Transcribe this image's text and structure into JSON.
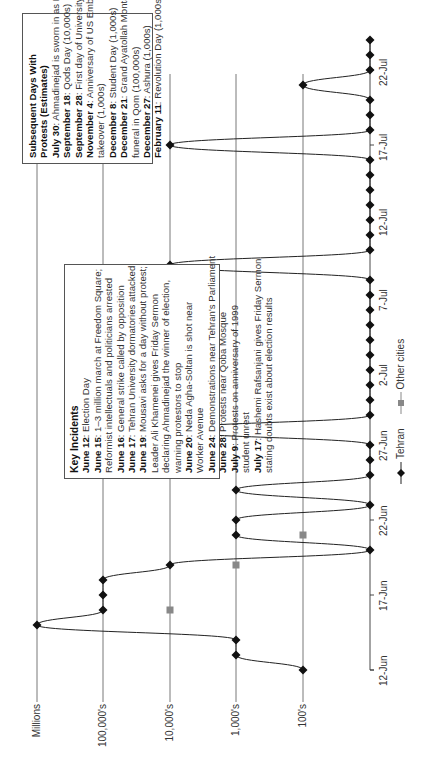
{
  "chart_data": {
    "type": "line",
    "title": "",
    "xlabel": "",
    "ylabel": "Estimated protest sizes",
    "y_scale": "ordinal-log",
    "y_levels": [
      "0",
      "100's",
      "1,000's",
      "10,000's",
      "100,000's",
      "Millions"
    ],
    "x_tick_labels": [
      "12-Jun",
      "17-Jun",
      "22-Jun",
      "27-Jun",
      "2-Jul",
      "7-Jul",
      "12-Jul",
      "17-Jul",
      "22-Jul"
    ],
    "x_range": [
      "12-Jun",
      "24-Jul"
    ],
    "grid": "horizontal lines at each size level",
    "legend_position": "bottom",
    "series": [
      {
        "name": "Tehran",
        "marker": "diamond",
        "color": "#111111",
        "points": [
          {
            "date": "12-Jun",
            "level": "100's"
          },
          {
            "date": "13-Jun",
            "level": "1,000's"
          },
          {
            "date": "14-Jun",
            "level": "1,000's"
          },
          {
            "date": "15-Jun",
            "level": "Millions"
          },
          {
            "date": "16-Jun",
            "level": "100,000's"
          },
          {
            "date": "17-Jun",
            "level": "100,000's"
          },
          {
            "date": "18-Jun",
            "level": "100,000's"
          },
          {
            "date": "19-Jun",
            "level": "10,000's"
          },
          {
            "date": "20-Jun",
            "level": "0"
          },
          {
            "date": "21-Jun",
            "level": "1,000's"
          },
          {
            "date": "22-Jun",
            "level": "1,000's"
          },
          {
            "date": "23-Jun",
            "level": "0"
          },
          {
            "date": "24-Jun",
            "level": "1,000's"
          },
          {
            "date": "25-Jun",
            "level": "0"
          },
          {
            "date": "26-Jun",
            "level": "0"
          },
          {
            "date": "27-Jun",
            "level": "0"
          },
          {
            "date": "28-Jun",
            "level": "10,000's"
          },
          {
            "date": "29-Jun",
            "level": "0"
          },
          {
            "date": "30-Jun",
            "level": "0"
          },
          {
            "date": "1-Jul",
            "level": "0"
          },
          {
            "date": "2-Jul",
            "level": "0"
          },
          {
            "date": "3-Jul",
            "level": "0"
          },
          {
            "date": "4-Jul",
            "level": "0"
          },
          {
            "date": "5-Jul",
            "level": "0"
          },
          {
            "date": "6-Jul",
            "level": "0"
          },
          {
            "date": "7-Jul",
            "level": "0"
          },
          {
            "date": "8-Jul",
            "level": "0"
          },
          {
            "date": "9-Jul",
            "level": "10,000's"
          },
          {
            "date": "10-Jul",
            "level": "0"
          },
          {
            "date": "11-Jul",
            "level": "0"
          },
          {
            "date": "12-Jul",
            "level": "0"
          },
          {
            "date": "13-Jul",
            "level": "0"
          },
          {
            "date": "14-Jul",
            "level": "0"
          },
          {
            "date": "15-Jul",
            "level": "0"
          },
          {
            "date": "16-Jul",
            "level": "0"
          },
          {
            "date": "17-Jul",
            "level": "10,000's"
          },
          {
            "date": "18-Jul",
            "level": "0"
          },
          {
            "date": "19-Jul",
            "level": "0"
          },
          {
            "date": "20-Jul",
            "level": "0"
          },
          {
            "date": "21-Jul",
            "level": "100's"
          },
          {
            "date": "22-Jul",
            "level": "0"
          },
          {
            "date": "23-Jul",
            "level": "0"
          },
          {
            "date": "24-Jul",
            "level": "0"
          }
        ]
      },
      {
        "name": "Other cities",
        "marker": "square",
        "color": "#808080",
        "points": [
          {
            "date": "16-Jun",
            "level": "10,000's"
          },
          {
            "date": "19-Jun",
            "level": "1,000's"
          },
          {
            "date": "21-Jun",
            "level": "100's"
          }
        ]
      }
    ],
    "annotations": [
      {
        "title": "Key Incidents",
        "entries": [
          {
            "date": "June 12",
            "text": "Election Day"
          },
          {
            "date": "June 15",
            "text": "1–3 million march at Freedom Square; Reformist intellectuals and politicians arrested"
          },
          {
            "date": "June 16",
            "text": "General strike called by opposition"
          },
          {
            "date": "June 17",
            "text": "Tehran University dormatories attacked"
          },
          {
            "date": "June 19",
            "text": "Mousavi asks for a day without protest; Leader Ali Khamenei gives Friday Sermon declaring Ahmadinejad the winner of election, warning protestors to stop"
          },
          {
            "date": "June 20",
            "text": "Neda Agha-Soltan is shot near Worker Avenue"
          },
          {
            "date": "June 24",
            "text": "Demonstrations near Tehran's Parliament"
          },
          {
            "date": "June 28",
            "text": "Protests near Qoba Mosque"
          },
          {
            "date": "July 9",
            "text": "Protests on anniversary of 1999 student unrest"
          },
          {
            "date": "July 17",
            "text": "Hashemi Rafsanjani gives Friday Sermon stating doubts exist about election results"
          }
        ]
      },
      {
        "title": "Subsequent Days With Protests (Estimates)",
        "entries": [
          {
            "date": "July 30",
            "text": "Ahmadinejad is sworn in as President (1,000s)"
          },
          {
            "date": "September 18",
            "text": "Qods Day (10,000s)"
          },
          {
            "date": "September 28",
            "text": "First day of University (1,000s)"
          },
          {
            "date": "November 4",
            "text": "Anniversary of US Embassy takeover (1,000s)"
          },
          {
            "date": "December 8",
            "text": "Student Day (1,000s)"
          },
          {
            "date": "December 21",
            "text": "Grand Ayatollah Montazeri's funeral in Qom (100,000s)"
          },
          {
            "date": "December 27",
            "text": "Ashura (1,000s)"
          },
          {
            "date": "February 11",
            "text": "Revolution Day (1,000s)"
          }
        ]
      }
    ]
  },
  "axis": {
    "y_title": "Estimated protest sizes",
    "y_labels": [
      "Millions",
      "100,000's",
      "10,000's",
      "1,000's",
      "100's"
    ],
    "x_labels": [
      "12-Jun",
      "17-Jun",
      "22-Jun",
      "27-Jun",
      "2-Jul",
      "7-Jul",
      "12-Jul",
      "17-Jul",
      "22-Jul"
    ]
  },
  "legend": {
    "tehran": "Tehran",
    "other": "Other cities"
  },
  "key_incidents": {
    "title": "Key Incidents",
    "lines": [
      {
        "b": "June 12",
        "t": ": Election Day"
      },
      {
        "b": "June 15",
        "t": ": 1–3 million march at Freedom Square;"
      },
      {
        "b": "",
        "t": "Reformist intellectuals and politicians arrested"
      },
      {
        "b": "June 16",
        "t": ": General strike called by opposition"
      },
      {
        "b": "June 17",
        "t": ": Tehran University dormatories attacked"
      },
      {
        "b": "June 19",
        "t": ": Mousavi asks for a day without protest;"
      },
      {
        "b": "",
        "t": "Leader Ali Khamenei gives Friday Sermon"
      },
      {
        "b": "",
        "t": "declaring Ahmadinejad the winner of election,"
      },
      {
        "b": "",
        "t": "warning protestors to stop"
      },
      {
        "b": "June 20",
        "t": ": Neda Agha-Soltan is shot near"
      },
      {
        "b": "",
        "t": "Worker Avenue"
      },
      {
        "b": "June 24",
        "t": ": Demonstrations near Tehran's Parliament"
      },
      {
        "b": "June 28",
        "t": ": Protests near Qoba Mosque"
      },
      {
        "b": "July 9",
        "t": ": Protests on anniversary of 1999"
      },
      {
        "b": "",
        "t": "student unrest"
      },
      {
        "b": "July 17",
        "t": ": Hashemi Rafsanjani gives Friday Sermon"
      },
      {
        "b": "",
        "t": "stating doubts exist about election results"
      }
    ]
  },
  "subsequent_days": {
    "title": "Subsequent Days With Protests (Estimates)",
    "lines": [
      {
        "b": "July 30",
        "t": ": Ahmadinejad is sworn in as President (1,000s)"
      },
      {
        "b": "September 18",
        "t": ": Qods Day (10,000s)"
      },
      {
        "b": "September 28",
        "t": ": First day of University (1,000s)"
      },
      {
        "b": "November 4",
        "t": ": Anniversary of US Embassy"
      },
      {
        "b": "",
        "t": "takeover (1,000s)"
      },
      {
        "b": "December 8",
        "t": ": Student Day (1,000s)"
      },
      {
        "b": "December 21",
        "t": ": Grand Ayatollah Montazeri's"
      },
      {
        "b": "",
        "t": "funeral in Qom (100,000s)"
      },
      {
        "b": "December 27",
        "t": ": Ashura (1,000s)"
      },
      {
        "b": "February 11",
        "t": ": Revolution Day (1,000s)"
      }
    ]
  }
}
